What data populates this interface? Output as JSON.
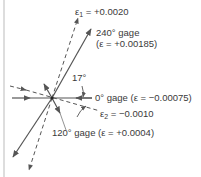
{
  "diagram": {
    "labels": {
      "eps1_sym": "ε",
      "eps1_sub": "1",
      "eps1_val": " = +0.0020",
      "g240_line1": "240° gage",
      "g240_line2": "(ε = +0.00185)",
      "angle": "17°",
      "g0": "0° gage (ε = −0.00075)",
      "eps2_sym": "ε",
      "eps2_sub": "2",
      "eps2_val": " = −0.0010",
      "g120": "120° gage (ε = +0.0004)"
    },
    "colors": {
      "line": "#555555",
      "text": "#3a3a3a",
      "border": "#bbbbbb"
    }
  }
}
